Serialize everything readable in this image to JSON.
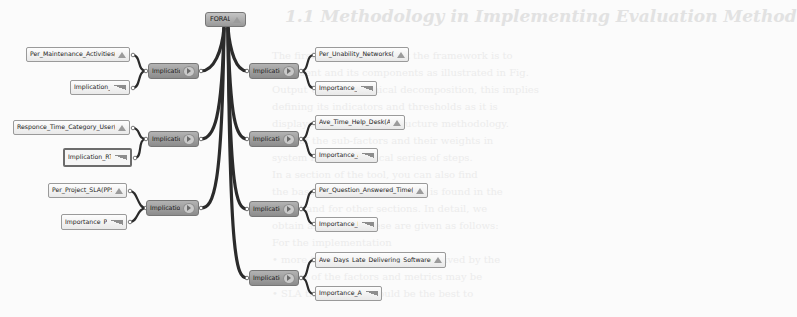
{
  "background": {
    "heading": "1.1 Methodology in Implementing Evaluation Method",
    "lines": [
      "The first step to implement the framework is to",
      "represent and its components as illustrated in Fig.",
      "Output Unit hierarchical decomposition, this implies",
      "defining its indicators and thresholds as it is",
      "displayed in the CLiBE structure methodology.",
      "each of the sub-factors and their weights in",
      "system in a hierarchical series of steps.",
      "In a section of the tool, you can also find",
      "the base measure metrics that is found in the",
      "model and for other sections. In detail, we",
      "obtain as follows: these are given as follows:",
      "For the implementation",
      "  • more than the component is derived by the",
      "  • there of the factors and metrics may be",
      "  • SLA the decision would be the best to"
    ]
  },
  "diagram": {
    "root": {
      "label": "FORALL",
      "icon": "triangle-up-icon"
    },
    "left": [
      {
        "label": "Implication7",
        "icon": "arrow-right-icon",
        "children": [
          {
            "label": "Per_Maintenance_Activities(PMA)",
            "icon": "triangle-up-icon"
          },
          {
            "label": "Implication_PMA",
            "icon": "ramp-icon"
          }
        ]
      },
      {
        "label": "Implication6",
        "icon": "arrow-right-icon",
        "children": [
          {
            "label": "Responce_Time_Category_User(RTCU)",
            "icon": "triangle-up-icon"
          },
          {
            "label": "Implication_RTCU",
            "icon": "ramp-icon",
            "selected": true
          }
        ]
      },
      {
        "label": "Implication5",
        "icon": "arrow-right-icon",
        "children": [
          {
            "label": "Per_Project_SLA(PPSLA)",
            "icon": "triangle-up-icon"
          },
          {
            "label": "Importance_PPSLA",
            "icon": "ramp-icon"
          }
        ]
      }
    ],
    "right": [
      {
        "label": "Implication1",
        "icon": "arrow-right-icon",
        "children": [
          {
            "label": "Per_Unability_Networks(RUN)",
            "icon": "triangle-up-icon"
          },
          {
            "label": "Importance_RUN",
            "icon": "ramp-icon"
          }
        ]
      },
      {
        "label": "Implication2",
        "icon": "arrow-right-icon",
        "children": [
          {
            "label": "Ave_Time_Help_Desk(ATHD)",
            "icon": "triangle-up-icon"
          },
          {
            "label": "Importance_ATHD",
            "icon": "ramp-icon"
          }
        ]
      },
      {
        "label": "Implication3",
        "icon": "arrow-right-icon",
        "children": [
          {
            "label": "Per_Question_Answered_Time(PQAT)",
            "icon": "triangle-up-icon"
          },
          {
            "label": "Importance_PQAT",
            "icon": "ramp-icon"
          }
        ]
      },
      {
        "label": "Implication4",
        "icon": "arrow-right-icon",
        "children": [
          {
            "label": "Ave_Days_Late_Delivering_Software(ADLDS)",
            "icon": "triangle-up-icon"
          },
          {
            "label": "Importance_ADLDS",
            "icon": "ramp-icon"
          }
        ]
      }
    ]
  },
  "colors": {
    "link": "#2b2b2b",
    "implication_fill": "#9f9f9f",
    "leaf_fill": "#f2f2f2"
  }
}
